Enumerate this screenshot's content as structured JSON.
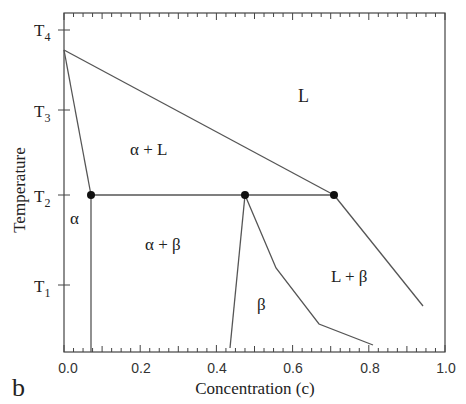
{
  "chart_data": {
    "type": "line",
    "subtype": "phase-diagram",
    "title": "",
    "panel_label": "b",
    "xlabel": "Concentration (c)",
    "ylabel": "Temperature",
    "xlim": [
      0.0,
      1.0
    ],
    "x_ticks": [
      "0.0",
      "0.2",
      "0.4",
      "0.6",
      "0.8",
      "1.0"
    ],
    "y_ticks": [
      {
        "label": "T",
        "sub": "1"
      },
      {
        "label": "T",
        "sub": "2"
      },
      {
        "label": "T",
        "sub": "3"
      },
      {
        "label": "T",
        "sub": "4"
      }
    ],
    "grid": false,
    "regions": [
      {
        "label": "L"
      },
      {
        "label": "α + L"
      },
      {
        "label": "α"
      },
      {
        "label": "α + β"
      },
      {
        "label": "β"
      },
      {
        "label": "L + β"
      }
    ],
    "lines": [
      {
        "name": "liquidus-upper",
        "points": [
          [
            0.0,
            3.75
          ],
          [
            0.71,
            2.0
          ]
        ]
      },
      {
        "name": "solidus-alpha",
        "points": [
          [
            0.0,
            3.75
          ],
          [
            0.07,
            2.0
          ]
        ]
      },
      {
        "name": "eutectic-isotherm",
        "points": [
          [
            0.07,
            2.0
          ],
          [
            0.71,
            2.0
          ]
        ]
      },
      {
        "name": "solvus-alpha",
        "points": [
          [
            0.07,
            2.0
          ],
          [
            0.07,
            0.0
          ]
        ]
      },
      {
        "name": "solvus-beta-left",
        "points": [
          [
            0.475,
            2.0
          ],
          [
            0.43,
            0.0
          ]
        ]
      },
      {
        "name": "beta-right-boundary",
        "points": [
          [
            0.475,
            2.0
          ],
          [
            0.56,
            1.25
          ],
          [
            0.67,
            0.55
          ],
          [
            0.8,
            0.2
          ]
        ]
      },
      {
        "name": "liquidus-beta",
        "points": [
          [
            0.71,
            2.0
          ],
          [
            0.94,
            0.72
          ]
        ]
      }
    ],
    "markers": [
      {
        "name": "alpha-eutectic-point",
        "x": 0.07,
        "y": 2.0
      },
      {
        "name": "beta-eutectic-point",
        "x": 0.475,
        "y": 2.0
      },
      {
        "name": "eutectic-point",
        "x": 0.71,
        "y": 2.0
      }
    ]
  }
}
